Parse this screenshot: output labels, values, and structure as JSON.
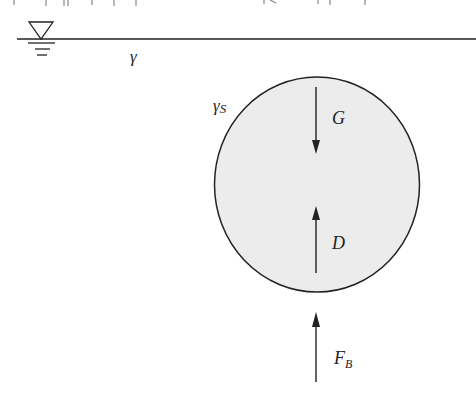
{
  "figure": {
    "type": "free-body diagram",
    "colors": {
      "stroke": "#222222",
      "sphere_fill": "#ececec",
      "background": "#ffffff"
    },
    "water_surface": {
      "symbol": "water-level-triangle",
      "fluid_label": "γ"
    },
    "particle": {
      "shape": "circle",
      "label_base": "γ",
      "label_sub": "S"
    },
    "forces": [
      {
        "id": "gravity",
        "label": "G",
        "direction": "down"
      },
      {
        "id": "drag",
        "label": "D",
        "direction": "up"
      },
      {
        "id": "buoyancy",
        "label_base": "F",
        "label_sub": "B",
        "direction": "up"
      }
    ]
  }
}
